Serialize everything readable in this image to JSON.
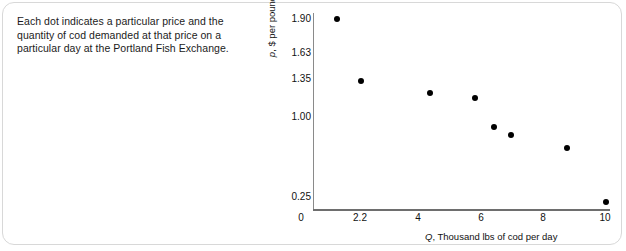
{
  "caption": {
    "text": "Each dot indicates a particular price and the quantity of cod demanded at that price on a particular day at the Portland Fish Exchange."
  },
  "chart_data": {
    "type": "scatter",
    "title": "",
    "xlabel_prefix": "Q",
    "xlabel": "Q, Thousand lbs of cod per day",
    "xlabel_rest": ", Thousand lbs of cod per day",
    "ylabel_prefix": "p",
    "ylabel": "p, $ per pound",
    "ylabel_rest": ", $ per pound",
    "xticks": [
      "0",
      "2.2",
      "4",
      "6",
      "8",
      "10"
    ],
    "xtick_values": [
      0,
      2.2,
      4,
      6,
      8,
      10
    ],
    "yticks": [
      "1.90",
      "1.63",
      "1.35",
      "1.00",
      "0.25"
    ],
    "ytick_values": [
      1.9,
      1.63,
      1.35,
      1.0,
      0.25
    ],
    "xlim": [
      0,
      10.3
    ],
    "ylim": [
      0.1,
      1.98
    ],
    "grid": false,
    "legend": null,
    "marker": "filled-circle",
    "marker_color": "#000000",
    "x": [
      1.3,
      2.2,
      4.4,
      5.9,
      6.5,
      7.0,
      8.8,
      10.0
    ],
    "y": [
      1.9,
      1.35,
      1.22,
      1.17,
      0.93,
      0.87,
      0.74,
      0.23
    ],
    "points": [
      {
        "x": 1.3,
        "y": 1.9
      },
      {
        "x": 2.2,
        "y": 1.35
      },
      {
        "x": 4.4,
        "y": 1.22
      },
      {
        "x": 5.9,
        "y": 1.17
      },
      {
        "x": 6.5,
        "y": 0.93
      },
      {
        "x": 7.0,
        "y": 0.87
      },
      {
        "x": 8.8,
        "y": 0.74
      },
      {
        "x": 10.0,
        "y": 0.23
      }
    ],
    "pixel_layout": {
      "ytick_tops": [
        10,
        44,
        70,
        108,
        188
      ],
      "xtick_lefts": [
        298,
        357,
        415,
        478,
        540,
        602
      ],
      "dot_positions": [
        {
          "left": 334,
          "top": 16
        },
        {
          "left": 358,
          "top": 78
        },
        {
          "left": 427,
          "top": 90
        },
        {
          "left": 472,
          "top": 95
        },
        {
          "left": 491,
          "top": 124
        },
        {
          "left": 508,
          "top": 132
        },
        {
          "left": 564,
          "top": 145
        },
        {
          "left": 603,
          "top": 199
        }
      ]
    }
  }
}
